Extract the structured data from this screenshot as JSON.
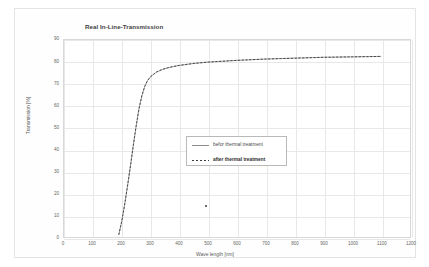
{
  "chart_data": {
    "type": "line",
    "title": "Real In-Line-Transmission",
    "xlabel": "Wave length [nm]",
    "ylabel": "Transmission [%]",
    "xlim": [
      0,
      1200
    ],
    "ylim": [
      0,
      90
    ],
    "xticks": [
      0,
      100,
      200,
      300,
      400,
      500,
      600,
      700,
      800,
      900,
      1000,
      1100,
      1200
    ],
    "yticks": [
      0,
      10,
      20,
      30,
      40,
      50,
      60,
      70,
      80,
      90
    ],
    "grid": true,
    "legend_position": "center",
    "series": [
      {
        "name": "befor thermal treatment",
        "style": "solid",
        "color": "#8c8c8c",
        "x": [
          190,
          200,
          210,
          220,
          230,
          240,
          250,
          260,
          270,
          280,
          290,
          300,
          320,
          340,
          360,
          380,
          400,
          450,
          500,
          550,
          600,
          650,
          700,
          750,
          800,
          850,
          900,
          950,
          1000,
          1050,
          1100
        ],
        "y": [
          1.0,
          7.0,
          14.5,
          23.0,
          32.0,
          41.5,
          50.5,
          58.5,
          64.5,
          68.8,
          71.5,
          73.2,
          75.3,
          76.5,
          77.3,
          77.9,
          78.4,
          79.3,
          79.9,
          80.3,
          80.7,
          81.0,
          81.3,
          81.5,
          81.7,
          81.9,
          82.1,
          82.2,
          82.3,
          82.4,
          82.5
        ]
      },
      {
        "name": "after thermal treatment",
        "style": "dashed",
        "color": "#3a3a3a",
        "x": [
          190,
          200,
          210,
          220,
          230,
          240,
          250,
          260,
          270,
          280,
          290,
          300,
          320,
          340,
          360,
          380,
          400,
          450,
          500,
          550,
          600,
          650,
          700,
          750,
          800,
          850,
          900,
          950,
          1000,
          1050,
          1100
        ],
        "y": [
          1.0,
          7.0,
          14.5,
          23.0,
          32.0,
          41.5,
          50.5,
          58.5,
          64.5,
          68.8,
          71.5,
          73.2,
          75.3,
          76.5,
          77.3,
          77.9,
          78.4,
          79.3,
          79.9,
          80.3,
          80.7,
          81.0,
          81.3,
          81.5,
          81.7,
          81.9,
          82.1,
          82.2,
          82.3,
          82.4,
          82.5
        ]
      }
    ],
    "annotations": [
      {
        "name": "stray-marker",
        "x": 490,
        "y": 15
      }
    ]
  },
  "legend": {
    "entries": [
      {
        "label": "befor thermal treatment"
      },
      {
        "label": "after thermal treatment"
      }
    ]
  }
}
